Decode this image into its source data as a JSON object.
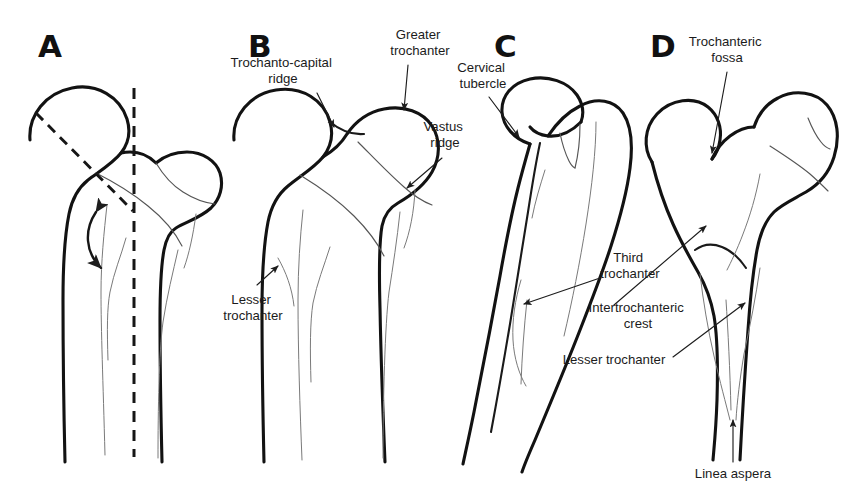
{
  "figure": {
    "background_color": "#ffffff",
    "ink_color": "#121212",
    "width": 852,
    "height": 499
  },
  "panels": [
    {
      "letter": "A",
      "letter_x": 38,
      "letter_y": 57,
      "description": "Proximal femur with dashed femoral neck axis, vertical shaft axis and neck-shaft angle arrow"
    },
    {
      "letter": "B",
      "letter_x": 248,
      "letter_y": 57,
      "description": "Proximal femur anterior view with trochanto-capital ridge, greater trochanter, vastus ridge and lesser trochanter"
    },
    {
      "letter": "C",
      "letter_x": 494,
      "letter_y": 57,
      "description": "Proximal femur oblique view with cervical tubercle, third trochanter, intertrochanteric crest and lesser trochanter"
    },
    {
      "letter": "D",
      "letter_x": 650,
      "letter_y": 57,
      "description": "Proximal femur posterior view with trochanteric fossa and linea aspera"
    }
  ],
  "annotations": [
    {
      "id": "trochanto-capital-ridge",
      "panel": "B",
      "lines": [
        "Trochanto-capital",
        "ridge"
      ],
      "text_x": 283,
      "text_y": 67,
      "align": "middle",
      "leader": {
        "x1": 317,
        "y1": 93,
        "x2": 334,
        "y2": 127
      }
    },
    {
      "id": "greater-trochanter",
      "panel": "B",
      "lines": [
        "Greater",
        "trochanter"
      ],
      "text_x": 420,
      "text_y": 39,
      "align": "middle",
      "leader": {
        "x1": 408,
        "y1": 65,
        "x2": 404,
        "y2": 110
      }
    },
    {
      "id": "vastus-ridge",
      "panel": "B",
      "lines": [
        "Vastus",
        "ridge"
      ],
      "text_x": 445,
      "text_y": 131,
      "align": "middle",
      "leader": {
        "x1": 442,
        "y1": 158,
        "x2": 407,
        "y2": 188
      }
    },
    {
      "id": "lesser-trochanter-b",
      "panel": "B",
      "lines": [
        "Lesser",
        "trochanter"
      ],
      "text_x": 253,
      "text_y": 304,
      "align": "middle",
      "leader": {
        "x1": 257,
        "y1": 285,
        "x2": 278,
        "y2": 268
      }
    },
    {
      "id": "cervical-tubercle",
      "panel": "C",
      "lines": [
        "Cervical",
        "tubercle"
      ],
      "text_x": 483,
      "text_y": 72,
      "align": "middle",
      "leader": {
        "x1": 489,
        "y1": 97,
        "x2": 519,
        "y2": 137
      }
    },
    {
      "id": "third-trochanter",
      "panel": "C",
      "lines": [
        "Third",
        "trochanter"
      ],
      "text_x": 630,
      "text_y": 262,
      "align": "middle",
      "leader": {
        "x1": 600,
        "y1": 278,
        "x2": 524,
        "y2": 304
      }
    },
    {
      "id": "intertrochanteric-crest",
      "panel": "C",
      "lines": [
        "Intertrochanteric",
        "crest"
      ],
      "text_x": 638,
      "text_y": 312,
      "align": "middle",
      "leader": {
        "x1": 614,
        "y1": 305,
        "x2": 706,
        "y2": 225
      }
    },
    {
      "id": "lesser-trochanter-c",
      "panel": "C",
      "lines": [
        "Lesser trochanter"
      ],
      "text_x": 614,
      "text_y": 364,
      "align": "middle",
      "leader": {
        "x1": 673,
        "y1": 357,
        "x2": 746,
        "y2": 302
      }
    },
    {
      "id": "trochanteric-fossa",
      "panel": "D",
      "lines": [
        "Trochanteric",
        "fossa"
      ],
      "text_x": 727,
      "text_y": 46,
      "align": "middle",
      "leader": {
        "x1": 727,
        "y1": 72,
        "x2": 712,
        "y2": 153
      }
    },
    {
      "id": "linea-aspera",
      "panel": "D",
      "lines": [
        "Linea aspera"
      ],
      "text_x": 733,
      "text_y": 478,
      "align": "middle",
      "leader": {
        "x1": 733,
        "y1": 462,
        "x2": 733,
        "y2": 420
      }
    }
  ],
  "guides": {
    "vertical_axis": {
      "panel": "A",
      "x": 134,
      "y1": 88,
      "y2": 455
    },
    "neck_axis": {
      "panel": "A",
      "x1": 36,
      "y1": 113,
      "x2": 113,
      "y2": 193
    },
    "neck_axis_extension": {
      "x1": 113,
      "y1": 193,
      "x2": 133,
      "y2": 211
    },
    "angle_arc_label": "neck-shaft angle"
  }
}
